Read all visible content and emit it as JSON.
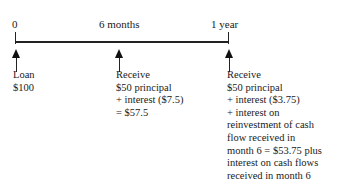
{
  "timeline": {
    "ticks": [
      {
        "label": "0"
      },
      {
        "label": "6 months"
      },
      {
        "label": "1 year"
      }
    ]
  },
  "events": [
    {
      "lines": [
        "Loan",
        "$100"
      ]
    },
    {
      "lines": [
        "Receive",
        "$50 principal",
        "+ interest ($7.5)",
        "= $57.5"
      ]
    },
    {
      "lines": [
        "Receive",
        "$50 principal",
        "+ interest ($3.75)",
        "+ interest on",
        "reinvestment of cash",
        "flow received in",
        "month 6 = $53.75 plus",
        "interest on cash flows",
        "received in month 6"
      ]
    }
  ]
}
